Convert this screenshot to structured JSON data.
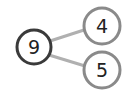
{
  "diagram": {
    "type": "number-bond",
    "whole": {
      "label": "9",
      "border_color": "#3a3a3a"
    },
    "parts": [
      {
        "label": "4",
        "border_color": "#8a8a8a"
      },
      {
        "label": "5",
        "border_color": "#8a8a8a"
      }
    ],
    "connector_color": "#b0b0b0"
  }
}
